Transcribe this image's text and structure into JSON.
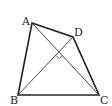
{
  "diagram": {
    "type": "geometry",
    "vertices": [
      {
        "name": "A",
        "x": 32,
        "y": 23,
        "label_x": 22,
        "label_y": 25
      },
      {
        "name": "D",
        "x": 73,
        "y": 37,
        "label_x": 74,
        "label_y": 36
      },
      {
        "name": "B",
        "x": 18,
        "y": 95,
        "label_x": 10,
        "label_y": 104
      },
      {
        "name": "C",
        "x": 99,
        "y": 95,
        "label_x": 100,
        "label_y": 104
      }
    ],
    "sides": [
      "AB",
      "BC",
      "CD",
      "DA"
    ],
    "diagonals": [
      "AC",
      "BD"
    ],
    "annotations": [
      {
        "type": "right-angle",
        "at": "intersection of AC and BD"
      }
    ],
    "labels": {
      "A": "A",
      "B": "B",
      "C": "C",
      "D": "D"
    }
  }
}
